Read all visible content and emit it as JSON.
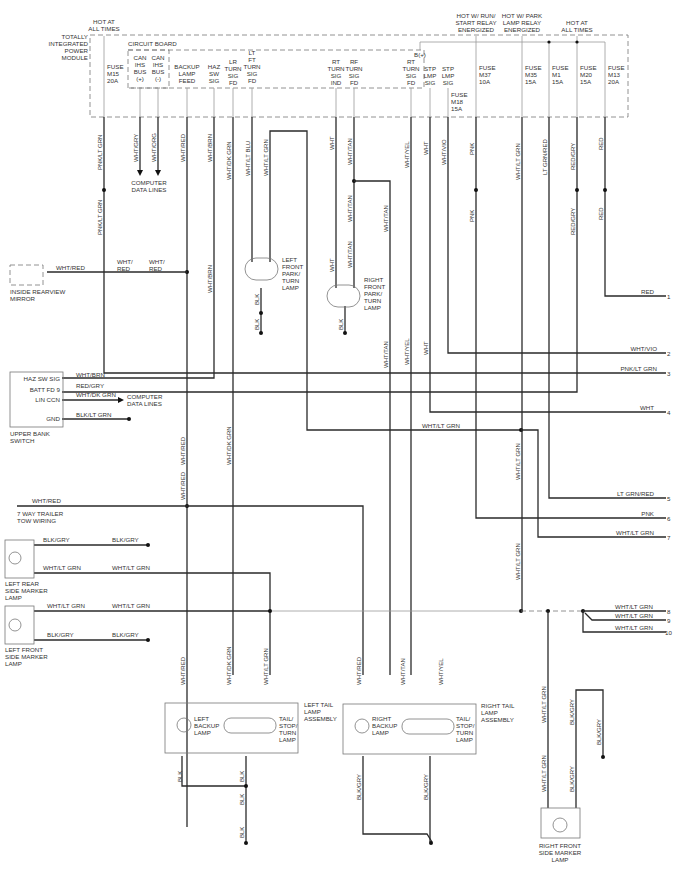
{
  "module": {
    "name_lines": [
      "TOTALLY",
      "INTEGRATED",
      "POWER",
      "MODULE"
    ],
    "hot_at_all_times_left": [
      "HOT AT",
      "ALL TIMES"
    ],
    "circuit_board": "CIRCUIT BOARD",
    "fuse_m15": [
      "FUSE",
      "M15",
      "20A"
    ],
    "pins": [
      {
        "id": "can_pos",
        "lines": [
          "CAN",
          "IHS",
          "BUS",
          "(+)"
        ]
      },
      {
        "id": "can_neg",
        "lines": [
          "CAN",
          "IHS",
          "BUS",
          "(-)"
        ]
      },
      {
        "id": "backup",
        "lines": [
          "BACKUP",
          "LAMP",
          "FEED"
        ]
      },
      {
        "id": "haz",
        "lines": [
          "HAZ",
          "SW",
          "SIG"
        ]
      },
      {
        "id": "lr_turn",
        "lines": [
          "LR",
          "TURN",
          "SIG",
          "FD"
        ]
      },
      {
        "id": "lf_turn",
        "lines": [
          "LT",
          "FT",
          "TURN",
          "SIG",
          "FD"
        ]
      },
      {
        "id": "rt_turn_ind",
        "lines": [
          "RT",
          "TURN",
          "SIG",
          "IND"
        ]
      },
      {
        "id": "rf_turn",
        "lines": [
          "RF",
          "TURN",
          "SIG",
          "FD"
        ]
      },
      {
        "id": "rt_turn_fd",
        "lines": [
          "RT",
          "TURN",
          "SIG",
          "FD"
        ]
      },
      {
        "id": "stp_sig1",
        "lines": [
          "STP",
          "LMP",
          "SIG"
        ]
      },
      {
        "id": "stp_sig2",
        "lines": [
          "STP",
          "LMP",
          "SIG"
        ]
      }
    ],
    "bplus": "B(+)",
    "fuse_m18": [
      "FUSE",
      "M18",
      "15A"
    ],
    "hot_run_start": [
      "HOT W/ RUN/",
      "START RELAY",
      "ENERGIZED"
    ],
    "hot_park": [
      "HOT W/ PARK",
      "LAMP RELAY",
      "ENERGIZED"
    ],
    "hot_at_all_times_right": [
      "HOT AT",
      "ALL TIMES"
    ],
    "fuses_right": [
      {
        "lines": [
          "FUSE",
          "M37",
          "10A"
        ]
      },
      {
        "lines": [
          "FUSE",
          "M35",
          "15A"
        ]
      },
      {
        "lines": [
          "FUSE",
          "M1",
          "15A"
        ]
      },
      {
        "lines": [
          "FUSE",
          "M20",
          "15A"
        ]
      },
      {
        "lines": [
          "FUSE",
          "M13",
          "20A"
        ]
      }
    ]
  },
  "wire_labels": {
    "pnk_lt_grn": "PNK/LT GRN",
    "wht_gry": "WHT/GRY",
    "wht_org": "WHT/ORG",
    "wht_red": "WHT/RED",
    "wht_brn": "WHT/BRN",
    "wht_dk_grn": "WHT/DK GRN",
    "wht_lt_blu": "WHT/LT BLU",
    "wht_lt_grn": "WHT/LT GRN",
    "wht": "WHT",
    "wht_tan": "WHT/TAN",
    "wht_yel": "WHT/YEL",
    "wht_vio": "WHT/VIO",
    "pnk": "PNK",
    "lt_grn_red": "LT GRN/RED",
    "red_gry": "RED/GRY",
    "red": "RED",
    "blk": "BLK",
    "blk_gry": "BLK/GRY",
    "blk_lt_grn": "BLK/LT GRN",
    "wht_slash": "WHT/",
    "red_only": "RED"
  },
  "computer_data_lines": [
    "COMPUTER",
    "DATA LINES"
  ],
  "components": {
    "mirror": [
      "INSIDE REARVIEW",
      "MIRROR"
    ],
    "lf_park": [
      "LEFT",
      "FRONT",
      "PARK/",
      "TURN",
      "LAMP"
    ],
    "rf_park": [
      "RIGHT",
      "FRONT",
      "PARK/",
      "TURN",
      "LAMP"
    ],
    "upper_bank": [
      "UPPER BANK",
      "SWITCH"
    ],
    "upper_bank_pins": [
      "HAZ SW SIG",
      "BATT FD 9",
      "LIN CCN",
      "GND"
    ],
    "trailer": [
      "7 WAY TRAILER",
      "TOW WIRING"
    ],
    "lr_side": [
      "LEFT REAR",
      "SIDE MARKER",
      "LAMP"
    ],
    "lf_side": [
      "LEFT FRONT",
      "SIDE MARKER",
      "LAMP"
    ],
    "left_tail": [
      "LEFT TAIL",
      "LAMP",
      "ASSEMBLY"
    ],
    "left_backup": [
      "LEFT",
      "BACKUP",
      "LAMP"
    ],
    "tail_stop": [
      "TAIL/",
      "STOP/",
      "TURN",
      "LAMP"
    ],
    "right_tail": [
      "RIGHT TAIL",
      "LAMP",
      "ASSEMBLY"
    ],
    "right_backup": [
      "RIGHT",
      "BACKUP",
      "LAMP"
    ],
    "rf_side": [
      "RIGHT FRONT",
      "SIDE MARKER",
      "LAMP"
    ]
  },
  "outputs": [
    {
      "num": "1",
      "label": "RED"
    },
    {
      "num": "2",
      "label": "WHT/VIO"
    },
    {
      "num": "3",
      "label": "PNK/LT GRN"
    },
    {
      "num": "4",
      "label": "WHT"
    },
    {
      "num": "5",
      "label": "LT GRN/RED"
    },
    {
      "num": "6",
      "label": "PNK"
    },
    {
      "num": "7",
      "label": "WHT/LT GRN"
    },
    {
      "num": "8",
      "label": "WHT/LT GRN"
    },
    {
      "num": "9",
      "label": "WHT/LT GRN"
    },
    {
      "num": "10",
      "label": "WHT/LT GRN"
    }
  ]
}
